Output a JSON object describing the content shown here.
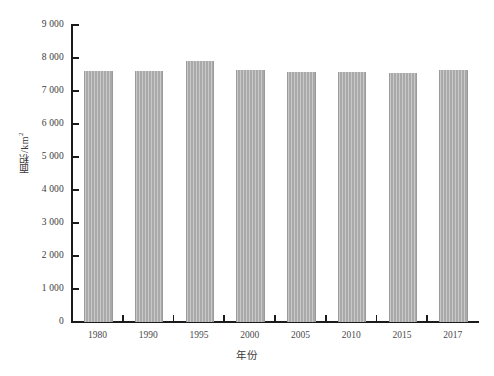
{
  "chart_data": {
    "type": "bar",
    "title": "",
    "subtitle": "",
    "xlabel": "年份",
    "ylabel": "面积/km²",
    "categories": [
      "1980",
      "1990",
      "1995",
      "2000",
      "2005",
      "2010",
      "2015",
      "2017"
    ],
    "values": [
      7620,
      7620,
      7900,
      7650,
      7580,
      7580,
      7550,
      7640
    ],
    "ylim": [
      0,
      9000
    ],
    "ytick_values": [
      0,
      1000,
      2000,
      3000,
      4000,
      5000,
      6000,
      7000,
      8000,
      9000
    ],
    "ytick_labels": [
      "0",
      "1 000",
      "2 000",
      "3 000",
      "4 000",
      "5 000",
      "6 000",
      "7 000",
      "8 000",
      "9 000"
    ],
    "grid": false,
    "legend": null,
    "legend_position": "none",
    "series": [
      {
        "name": "面积",
        "values": [
          7620,
          7620,
          7900,
          7650,
          7580,
          7580,
          7550,
          7640
        ],
        "color": "#a9a9a9"
      }
    ],
    "colors": {
      "bar_fill": "#a9a9a9",
      "bar_edge": "#9b9b9b",
      "axis": "#1b1b1b",
      "tick_text": "#3a3a3a",
      "background": "#ffffff"
    }
  },
  "axis": {
    "y_unit_superscript": "2",
    "y_unit_base": "面积/km"
  }
}
